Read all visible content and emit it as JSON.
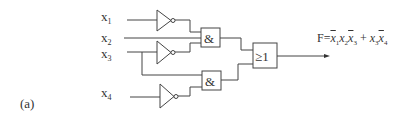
{
  "figure": {
    "label": "(a)"
  },
  "inputs": [
    {
      "name": "x",
      "index": "1"
    },
    {
      "name": "x",
      "index": "2"
    },
    {
      "name": "x",
      "index": "3"
    },
    {
      "name": "x",
      "index": "4"
    }
  ],
  "gates": {
    "and_symbol": "&",
    "or_symbol": "≥1",
    "not_count": 3,
    "and_count": 2,
    "or_count": 1
  },
  "output": {
    "prefix": "F=",
    "terms": [
      {
        "var": "x",
        "idx": "1",
        "negated": true
      },
      {
        "var": "x",
        "idx": "2",
        "negated": false
      },
      {
        "var": "x",
        "idx": "3",
        "negated": true
      },
      {
        "op": " + "
      },
      {
        "var": "x",
        "idx": "3",
        "negated": false
      },
      {
        "var": "x",
        "idx": "4",
        "negated": true
      }
    ],
    "expression_text": "F = x̄1 x2 x̄3 + x3 x̄4"
  },
  "colors": {
    "line": "#444444",
    "text": "#333333",
    "background": "#ffffff"
  }
}
